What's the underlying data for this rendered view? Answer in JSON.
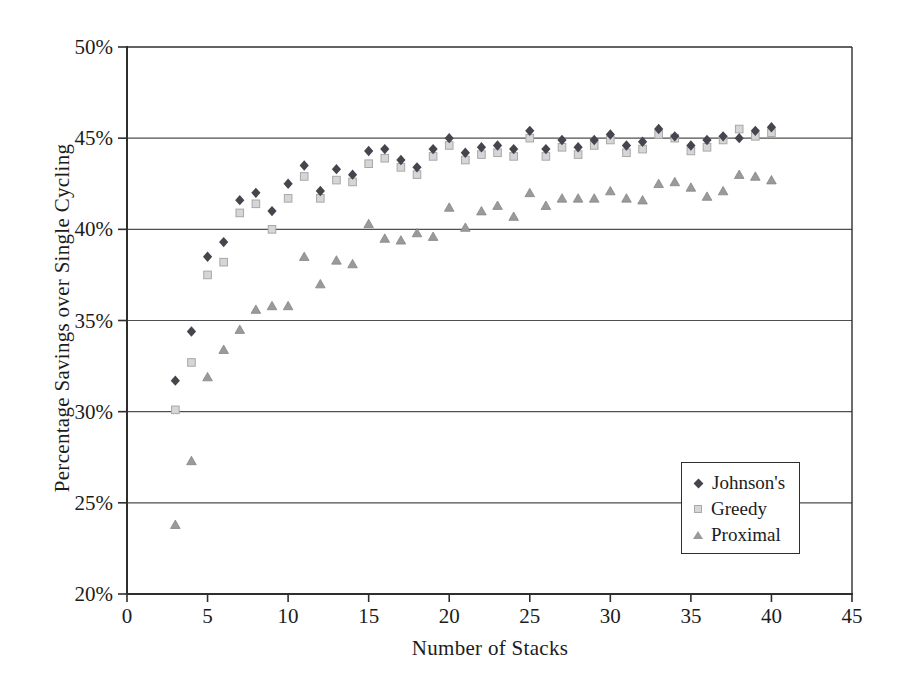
{
  "chart_data": {
    "type": "scatter",
    "title": "",
    "xlabel": "Number of Stacks",
    "ylabel": "Percentage Savings over Single Cycling",
    "xlim": [
      0,
      45
    ],
    "ylim": [
      20,
      50
    ],
    "x_ticks": [
      0,
      5,
      10,
      15,
      20,
      25,
      30,
      35,
      40,
      45
    ],
    "x_tick_labels": [
      "0",
      "5",
      "10",
      "15",
      "20",
      "25",
      "30",
      "35",
      "40",
      "45"
    ],
    "y_ticks": [
      20,
      25,
      30,
      35,
      40,
      45,
      50
    ],
    "y_tick_labels": [
      "20%",
      "25%",
      "30%",
      "35%",
      "40%",
      "45%",
      "50%"
    ],
    "grid": "horizontal",
    "legend_position": "inside lower right",
    "x": [
      3,
      4,
      5,
      6,
      7,
      8,
      9,
      10,
      11,
      12,
      13,
      14,
      15,
      16,
      17,
      18,
      19,
      20,
      21,
      22,
      23,
      24,
      25,
      26,
      27,
      28,
      29,
      30,
      31,
      32,
      33,
      34,
      35,
      36,
      37,
      38,
      39,
      40
    ],
    "series": [
      {
        "name": "Johnson's",
        "marker": "diamond",
        "color": "#45454d",
        "values": [
          31.7,
          34.4,
          38.5,
          39.3,
          41.6,
          42.0,
          41.0,
          42.5,
          43.5,
          42.1,
          43.3,
          43.0,
          44.3,
          44.4,
          43.8,
          43.4,
          44.4,
          45.0,
          44.2,
          44.5,
          44.6,
          44.4,
          45.4,
          44.4,
          44.9,
          44.5,
          44.9,
          45.2,
          44.6,
          44.8,
          45.5,
          45.1,
          44.6,
          44.9,
          45.1,
          45.0,
          45.4,
          45.6
        ]
      },
      {
        "name": "Greedy",
        "marker": "square",
        "color": "#d6d6d6",
        "edge_color": "#a8a8a8",
        "values": [
          30.1,
          32.7,
          37.5,
          38.2,
          40.9,
          41.4,
          40.0,
          41.7,
          42.9,
          41.7,
          42.7,
          42.6,
          43.6,
          43.9,
          43.4,
          43.0,
          44.0,
          44.6,
          43.8,
          44.1,
          44.2,
          44.0,
          45.0,
          44.0,
          44.5,
          44.1,
          44.6,
          44.9,
          44.2,
          44.4,
          45.2,
          45.0,
          44.3,
          44.5,
          44.9,
          45.5,
          45.1,
          45.3
        ]
      },
      {
        "name": "Proximal",
        "marker": "triangle",
        "color": "#9a9a9a",
        "edge_color": "#868686",
        "values": [
          23.8,
          27.3,
          31.9,
          33.4,
          34.5,
          35.6,
          35.8,
          35.8,
          38.5,
          37.0,
          38.3,
          38.1,
          40.3,
          39.5,
          39.4,
          39.8,
          39.6,
          41.2,
          40.1,
          41.0,
          41.3,
          40.7,
          42.0,
          41.3,
          41.7,
          41.7,
          41.7,
          42.1,
          41.7,
          41.6,
          42.5,
          42.6,
          42.3,
          41.8,
          42.1,
          43.0,
          42.9,
          42.7
        ]
      }
    ]
  },
  "style": {
    "axis_color": "#2e2e2e",
    "grid_color": "#4f4f4f",
    "text_color": "#1c1c1c",
    "background": "#ffffff"
  }
}
